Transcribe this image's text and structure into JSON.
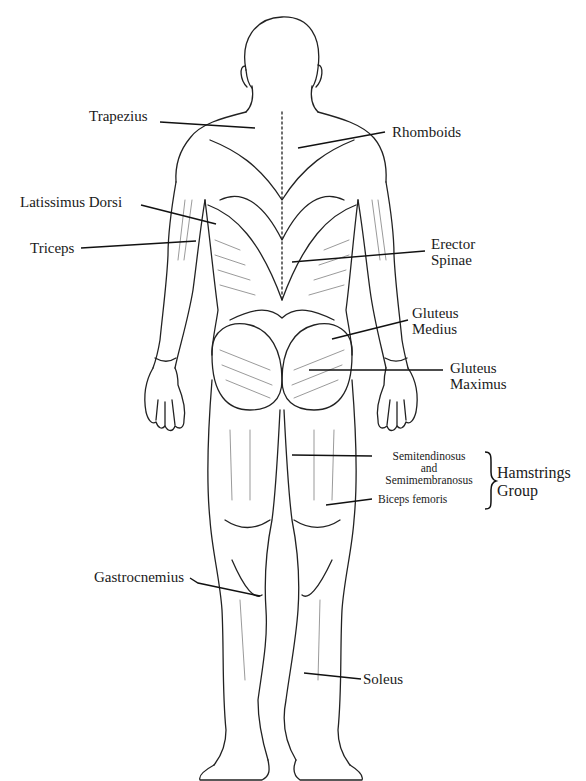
{
  "diagram": {
    "labels": {
      "trapezius": "Trapezius",
      "rhomboids": "Rhomboids",
      "latissimus_dorsi": "Latissimus Dorsi",
      "triceps": "Triceps",
      "erector_spinae_1": "Erector",
      "erector_spinae_2": "Spinae",
      "gluteus_medius_1": "Gluteus",
      "gluteus_medius_2": "Medius",
      "gluteus_maximus_1": "Gluteus",
      "gluteus_maximus_2": "Maximus",
      "semitendinosus": "Semitendinosus",
      "and": "and",
      "semimembranosus": "Semimembranosus",
      "biceps_femoris": "Biceps femoris",
      "hamstrings_group_1": "Hamstrings",
      "hamstrings_group_2": "Group",
      "gastrocnemius": "Gastrocnemius",
      "soleus": "Soleus"
    },
    "colors": {
      "ink": "#1a1a1a",
      "background": "#ffffff"
    }
  }
}
